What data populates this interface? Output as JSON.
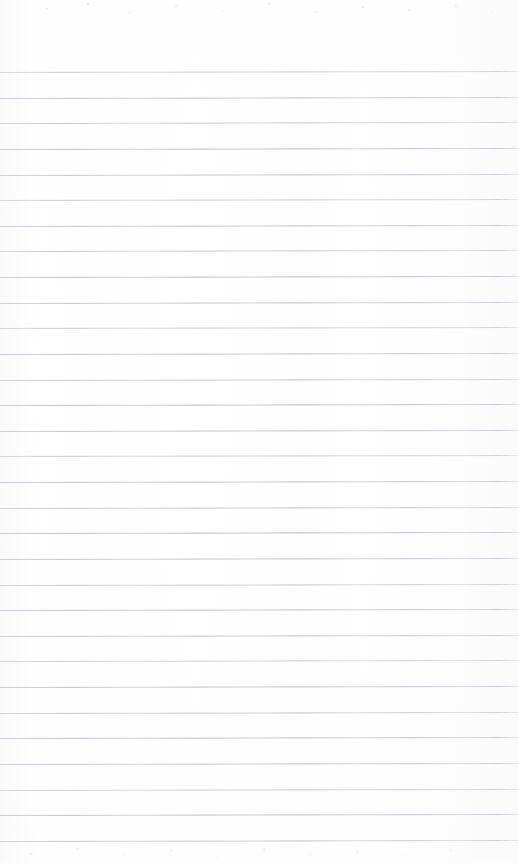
{
  "document": {
    "type": "scanned-ruled-notebook-page",
    "title": "Blank ruled notebook page",
    "page_width_px": 518,
    "page_height_px": 863,
    "has_text_content": false,
    "text_content": "",
    "handwriting": "none",
    "printed_text": "none",
    "page_number_label": "",
    "header_text": "",
    "footer_text": ""
  },
  "paper": {
    "background_color": "#fefefe",
    "tint_color": "#fafaf9",
    "edge_shade_color": "#f6f6f7",
    "margin_top_px": 72,
    "margin_bottom_px": 22,
    "margin_left_px": 0,
    "margin_right_px": 0
  },
  "ruling": {
    "style": "wide-ruled-horizontal",
    "line_color": "#b0b4bb",
    "line_thickness_px": 1,
    "line_spacing_px": 25.63,
    "first_line_y_px": 72,
    "last_line_y_px": 841,
    "line_count": 31,
    "line_start_x_px": 0,
    "line_end_x_px": 518,
    "full_bleed": true,
    "skew_degrees": -0.11,
    "vertical_margin_rule": false,
    "vertical_margin_rule_color": "",
    "line_positions_y_px": [
      72,
      97.6,
      123.3,
      148.9,
      174.5,
      200.1,
      225.8,
      251.4,
      277,
      302.6,
      328.3,
      353.9,
      379.5,
      405.1,
      430.8,
      456.4,
      482,
      507.6,
      533.3,
      558.9,
      584.5,
      610.1,
      635.8,
      661.4,
      687,
      712.6,
      738.3,
      763.9,
      789.5,
      815.1,
      841
    ]
  },
  "annotations": {
    "marks": [],
    "stamps": [],
    "doodles": []
  }
}
